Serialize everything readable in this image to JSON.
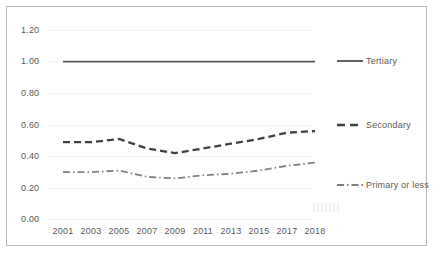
{
  "chart_data": {
    "type": "line",
    "title": "",
    "subtitle": "",
    "xlabel": "",
    "ylabel": "",
    "x": [
      "2001",
      "2003",
      "2005",
      "2007",
      "2009",
      "2011",
      "2013",
      "2015",
      "2017",
      "2018"
    ],
    "categories": [
      "2001",
      "2003",
      "2005",
      "2007",
      "2009",
      "2011",
      "2013",
      "2015",
      "2017",
      "2018"
    ],
    "ylim": [
      0.0,
      1.2
    ],
    "y_ticks": [
      "0.00",
      "0.20",
      "0.40",
      "0.60",
      "0.80",
      "1.00",
      "1.20"
    ],
    "y_tick_values": [
      0.0,
      0.2,
      0.4,
      0.6,
      0.8,
      1.0,
      1.2
    ],
    "grid": true,
    "grid_axis": "y",
    "legend_position": "right",
    "series": [
      {
        "name": "Tertiary",
        "style": "solid",
        "color": "#595959",
        "values": [
          1.0,
          1.0,
          1.0,
          1.0,
          1.0,
          1.0,
          1.0,
          1.0,
          1.0,
          1.0
        ]
      },
      {
        "name": "Secondary",
        "style": "dashed",
        "color": "#404040",
        "values": [
          0.49,
          0.49,
          0.51,
          0.45,
          0.42,
          0.45,
          0.48,
          0.51,
          0.55,
          0.56
        ]
      },
      {
        "name": "Primary or less",
        "style": "dash-dot",
        "color": "#808080",
        "values": [
          0.3,
          0.3,
          0.31,
          0.27,
          0.26,
          0.28,
          0.29,
          0.31,
          0.34,
          0.36
        ]
      }
    ]
  },
  "legend": {
    "items": [
      {
        "label": "Tertiary"
      },
      {
        "label": "Secondary"
      },
      {
        "label": "Primary or less"
      }
    ]
  },
  "axes": {
    "y_labels": [
      "1.20",
      "1.00",
      "0.80",
      "0.60",
      "0.40",
      "0.20",
      "0.00"
    ],
    "x_labels": [
      "2001",
      "2003",
      "2005",
      "2007",
      "2009",
      "2011",
      "2013",
      "2015",
      "2017",
      "2018"
    ]
  },
  "colors": {
    "border": "#b9b9b9",
    "gridline": "#f2f2f2",
    "text": "#595959",
    "tertiary": "#595959",
    "secondary": "#404040",
    "primary_or_less": "#808080"
  }
}
